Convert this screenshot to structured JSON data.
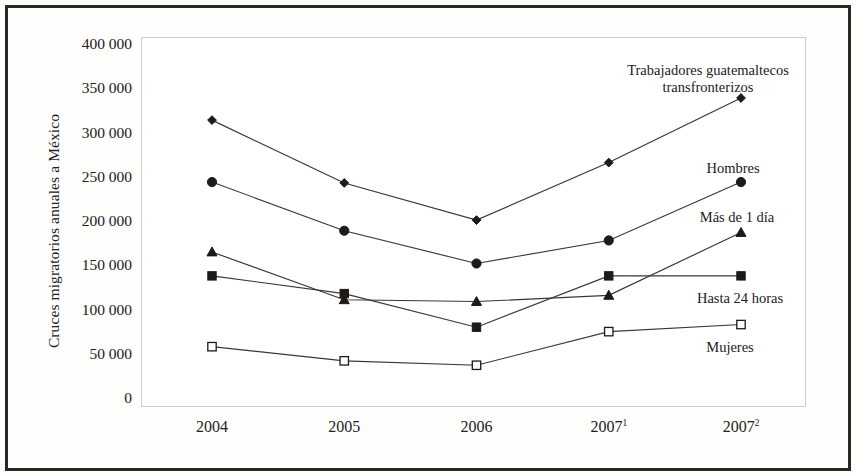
{
  "figure": {
    "y_axis_title": "Cruces migratorios anuales a México"
  },
  "chart_data": {
    "type": "line",
    "title": "",
    "xlabel": "",
    "ylabel": "Cruces migratorios anuales a México",
    "categories": [
      "2004",
      "2005",
      "2006",
      "2007¹",
      "2007²"
    ],
    "category_labels": [
      {
        "text": "2004",
        "sup": ""
      },
      {
        "text": "2005",
        "sup": ""
      },
      {
        "text": "2006",
        "sup": ""
      },
      {
        "text": "2007",
        "sup": "1"
      },
      {
        "text": "2007",
        "sup": "2"
      }
    ],
    "ylim": [
      0,
      400000
    ],
    "ytick_values": [
      0,
      50000,
      100000,
      150000,
      200000,
      250000,
      300000,
      350000,
      400000
    ],
    "ytick_labels": [
      "0",
      "50 000",
      "100 000",
      "150 000",
      "200 000",
      "250 000",
      "300 000",
      "350 000",
      "400 000"
    ],
    "grid": false,
    "legend": "inline-annotations",
    "series": [
      {
        "name": "Trabajadores guatemaltecos transfronterizos",
        "label_lines": [
          "Trabajadores guatemaltecos",
          "transfronterizos"
        ],
        "marker": "filled-diamond",
        "color": "#1d1a17",
        "values": [
          314000,
          243000,
          201000,
          266000,
          339000
        ]
      },
      {
        "name": "Hombres",
        "label_lines": [
          "Hombres"
        ],
        "marker": "filled-circle",
        "color": "#1d1a17",
        "values": [
          244000,
          189000,
          152000,
          178000,
          244000
        ]
      },
      {
        "name": "Más de 1 día",
        "label_lines": [
          "Más de 1 día"
        ],
        "marker": "filled-triangle",
        "color": "#1d1a17",
        "values": [
          165000,
          111000,
          109000,
          116000,
          187000
        ]
      },
      {
        "name": "Hasta 24 horas",
        "label_lines": [
          "Hasta 24 horas"
        ],
        "marker": "filled-square",
        "color": "#1d1a17",
        "values": [
          138000,
          118000,
          80000,
          138000,
          138000
        ]
      },
      {
        "name": "Mujeres",
        "label_lines": [
          "Mujeres"
        ],
        "marker": "open-square",
        "color": "#1d1a17",
        "values": [
          58000,
          42000,
          37000,
          75000,
          83000
        ]
      }
    ],
    "annotations": [
      {
        "series": "Trabajadores guatemaltecos transfronterizos",
        "x_px": 708,
        "y_px": 62
      },
      {
        "series": "Hombres",
        "x_px": 733,
        "y_px": 160
      },
      {
        "series": "Más de 1 día",
        "x_px": 737,
        "y_px": 209
      },
      {
        "series": "Hasta 24 horas",
        "x_px": 740,
        "y_px": 290
      },
      {
        "series": "Mujeres",
        "x_px": 730,
        "y_px": 339
      }
    ],
    "colors": {
      "frame": "#2b2824",
      "plot_border": "#cfcdc8",
      "line": "#3a3630",
      "text": "#23201d",
      "background": "#fefefc"
    }
  }
}
